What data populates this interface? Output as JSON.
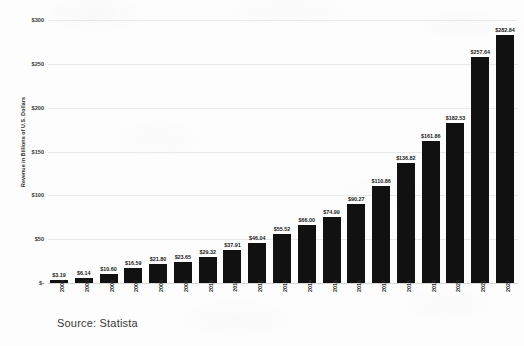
{
  "chart_data": {
    "type": "bar",
    "title": "",
    "xlabel": "",
    "ylabel": "Revenue in Billions of U.S. Dollars",
    "ylim": [
      0,
      300
    ],
    "grid": true,
    "legend": null,
    "y_ticks": [
      "$-",
      "$50",
      "$100",
      "$150",
      "$200",
      "$250",
      "$300"
    ],
    "y_tick_values": [
      0,
      50,
      100,
      150,
      200,
      250,
      300
    ],
    "categories": [
      "2004",
      "2005",
      "2006",
      "2007",
      "2008",
      "2009",
      "2010",
      "2011",
      "2012",
      "2013",
      "2014",
      "2015",
      "2016",
      "2017",
      "2018",
      "2019",
      "2020",
      "2021",
      "2022"
    ],
    "values": [
      3.19,
      6.14,
      10.6,
      16.59,
      21.8,
      23.65,
      29.32,
      37.91,
      46.04,
      55.52,
      66.0,
      74.99,
      90.27,
      110.86,
      136.82,
      161.86,
      182.53,
      257.64,
      282.84
    ],
    "data_labels": [
      "$3.19",
      "$6.14",
      "$10.60",
      "$16.59",
      "$21.80",
      "$23.65",
      "$29.32",
      "$37.91",
      "$46.04",
      "$55.52",
      "$66.00",
      "$74.99",
      "$90.27",
      "$110.86",
      "$136.82",
      "$161.86",
      "$182.53",
      "$257.64",
      "$282.84"
    ],
    "bar_color": "#111111",
    "gridline_color": "#e9e9e9"
  },
  "source": {
    "caption": "Source: Statista"
  }
}
